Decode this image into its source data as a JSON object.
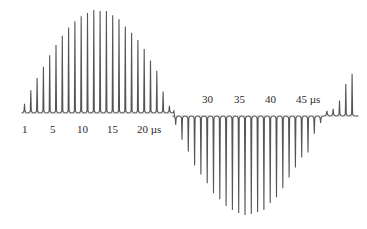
{
  "chart_data": {
    "type": "line",
    "title": "",
    "xlabel": "",
    "ylabel": "",
    "grid": false,
    "legend": null,
    "x_unit": "µs",
    "x_tick_labels_upper": [
      "1",
      "5",
      "10",
      "15",
      "20 µs"
    ],
    "x_tick_labels_lower": [
      "30",
      "35",
      "40",
      "45 µs"
    ],
    "pulse_period_us": 1,
    "series": [
      {
        "name": "positive pulses",
        "x": [
          1,
          2,
          3,
          4,
          5,
          6,
          7,
          8,
          9,
          10,
          11,
          12,
          13,
          14,
          15,
          16,
          17,
          18,
          19,
          20,
          21,
          22,
          23,
          24
        ],
        "values": [
          0.09,
          0.22,
          0.34,
          0.45,
          0.56,
          0.66,
          0.75,
          0.83,
          0.89,
          0.94,
          0.97,
          1.0,
          0.99,
          0.99,
          0.95,
          0.91,
          0.84,
          0.78,
          0.71,
          0.62,
          0.51,
          0.41,
          0.21,
          0.07
        ]
      },
      {
        "name": "negative pulses",
        "x": [
          25,
          26,
          27,
          28,
          29,
          30,
          31,
          32,
          33,
          34,
          35,
          36,
          37,
          38,
          39,
          40,
          41,
          42,
          43,
          44,
          45,
          46,
          47,
          48
        ],
        "values": [
          -0.09,
          -0.24,
          -0.36,
          -0.5,
          -0.59,
          -0.68,
          -0.78,
          -0.84,
          -0.91,
          -0.95,
          -0.98,
          -1.0,
          -0.99,
          -0.97,
          -0.95,
          -0.88,
          -0.82,
          -0.73,
          -0.62,
          -0.52,
          -0.42,
          -0.37,
          -0.18,
          -0.07
        ]
      },
      {
        "name": "trailing positive pulses",
        "x": [
          49,
          50,
          51,
          52,
          53
        ],
        "values": [
          0.05,
          0.07,
          0.15,
          0.31,
          0.41
        ]
      }
    ],
    "ylim": [
      -1.05,
      1.05
    ]
  },
  "labels": {
    "upper": [
      {
        "text": "1",
        "x": 22
      },
      {
        "text": "5",
        "x": 50
      },
      {
        "text": "10",
        "x": 77
      },
      {
        "text": "15",
        "x": 107
      },
      {
        "text": "20 µs",
        "x": 137
      }
    ],
    "lower": [
      {
        "text": "30",
        "x": 202
      },
      {
        "text": "35",
        "x": 234
      },
      {
        "text": "40",
        "x": 265
      },
      {
        "text": "45 µs",
        "x": 296
      }
    ]
  },
  "colors": {
    "trace": "#555555",
    "text": "#2a2a2a",
    "background": "#ffffff"
  }
}
